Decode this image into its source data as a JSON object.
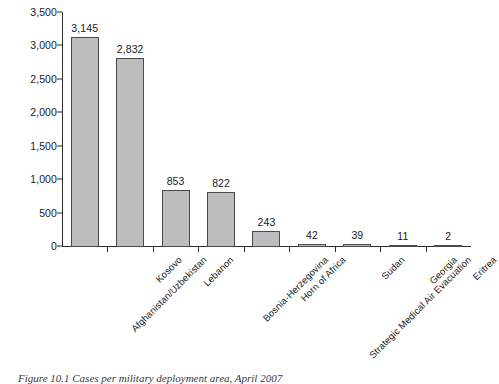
{
  "figure": {
    "caption": "Figure 10.1 Cases per military deployment area, April 2007"
  },
  "chart_data": {
    "type": "bar",
    "title": "",
    "xlabel": "",
    "ylabel": "",
    "ylim": [
      0,
      3500
    ],
    "grid": false,
    "legend": null,
    "categories": [
      "Afghanistan/Uzbekistan",
      "Kosovo",
      "Lebanon",
      "Bosnia-Herzegovina",
      "Horn of Africa",
      "Strategic Medical Air Evacuation",
      "Sudan",
      "Georgia",
      "Eritrea"
    ],
    "values": [
      3145,
      2832,
      853,
      822,
      243,
      42,
      39,
      11,
      2
    ],
    "value_labels": [
      "3,145",
      "2,832",
      "853",
      "822",
      "243",
      "42",
      "39",
      "11",
      "2"
    ],
    "yticks": [
      0,
      500,
      1000,
      1500,
      2000,
      2500,
      3000,
      3500
    ],
    "ytick_labels": [
      "0",
      "500",
      "1,000",
      "1,500",
      "2,000",
      "2,500",
      "3,000",
      "3,500"
    ],
    "colors": {
      "bar_fill": "#bdbdbd",
      "bar_border": "#4a4a4a",
      "axis": "#2b2b2b",
      "text": "#1a1a1a",
      "background": "#ffffff"
    }
  }
}
